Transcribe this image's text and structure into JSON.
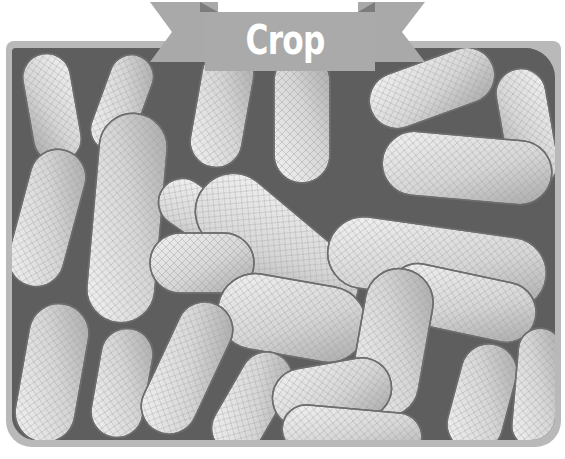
{
  "banner": {
    "label": "Crop",
    "color": "#a9a9a9",
    "text_color": "#ffffff"
  },
  "frame": {
    "color": "#b9b9b9"
  },
  "photo": {
    "subject": "pile of unshelled peanuts in pods",
    "style": "grayscale"
  }
}
